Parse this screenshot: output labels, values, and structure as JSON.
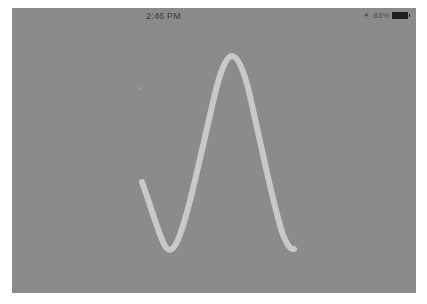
{
  "status_bar": {
    "time": "2:46 PM",
    "bluetooth_icon": "bluetooth-icon",
    "battery_percent": "83%",
    "battery_icon": "battery-icon"
  },
  "canvas": {
    "background_color": "#8b8b8b",
    "stroke_color": "#c9c9c9",
    "stroke_width": 6,
    "drawn_stroke": {
      "description": "Freehand wave stroke: descends to a trough, rises to a tall peak, descends again",
      "points": [
        [
          130,
          174
        ],
        [
          155,
          241
        ],
        [
          219,
          49
        ],
        [
          282,
          241
        ]
      ]
    }
  },
  "colors": {
    "frame": "#ffffff",
    "screen": "#8b8b8b",
    "stroke": "#c9c9c9",
    "status_text": "#3c3c3c"
  }
}
